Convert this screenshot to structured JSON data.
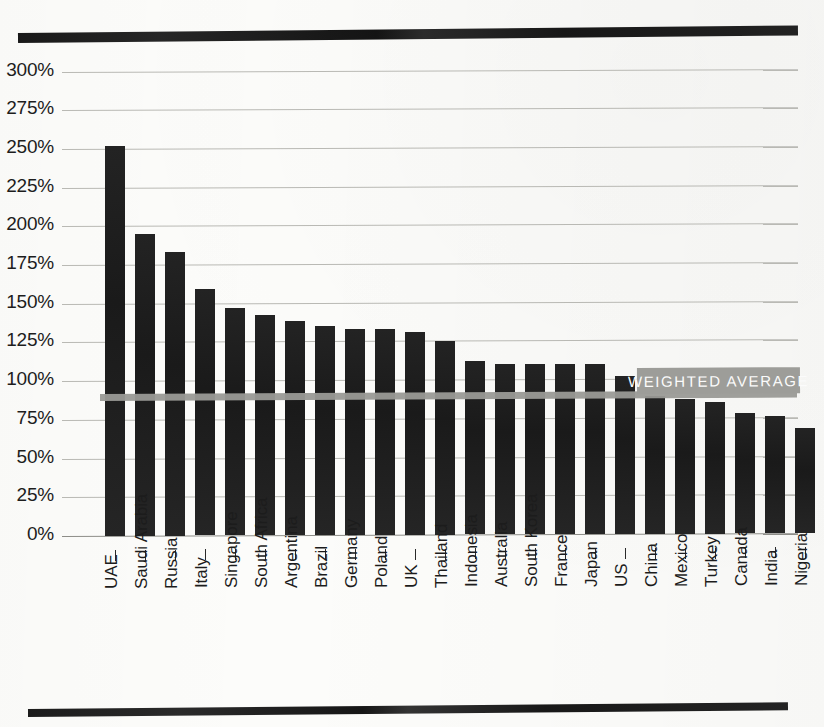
{
  "figure": {
    "weighted_average_label": "WEIGHTED AVERAGE",
    "weighted_average_value": 90,
    "partial_caption": ""
  },
  "colors": {
    "bar": "#1f1f1f",
    "gridline": "#b9b9b4",
    "weighted_average": "#9a9a96",
    "weighted_average_text": "#fbfbfb",
    "rule": "#1b1b1b",
    "paper": "#fcfcfa",
    "text": "#1a1a1a"
  },
  "chart_data": {
    "type": "bar",
    "title": "",
    "subtitle": "",
    "xlabel": "",
    "ylabel": "",
    "ylim": [
      0,
      300
    ],
    "ytick_values": [
      0,
      25,
      50,
      75,
      100,
      125,
      150,
      175,
      200,
      225,
      250,
      275,
      300
    ],
    "ytick_labels": [
      "0%",
      "25%",
      "50%",
      "75%",
      "100%",
      "125%",
      "150%",
      "175%",
      "200%",
      "225%",
      "250%",
      "275%",
      "300%"
    ],
    "grid": true,
    "legend": null,
    "categories": [
      "UAE",
      "Saudi Arabia",
      "Russia",
      "Italy",
      "Singapore",
      "South Africa",
      "Argentina",
      "Brazil",
      "Germany",
      "Poland",
      "UK",
      "Thailand",
      "Indonesia",
      "Australia",
      "South Korea",
      "France",
      "Japan",
      "US",
      "China",
      "Mexico",
      "Turkey",
      "Canada",
      "India",
      "Nigeria"
    ],
    "values": [
      252,
      195,
      183,
      159,
      147,
      142,
      138,
      135,
      133,
      133,
      131,
      125,
      112,
      110,
      110,
      110,
      110,
      102,
      89,
      87,
      85,
      78,
      76,
      68
    ],
    "annotations": [
      {
        "text": "WEIGHTED AVERAGE",
        "type": "hline-label",
        "y": 90,
        "x_start_category": "US",
        "x_end_category": "Nigeria"
      }
    ]
  }
}
